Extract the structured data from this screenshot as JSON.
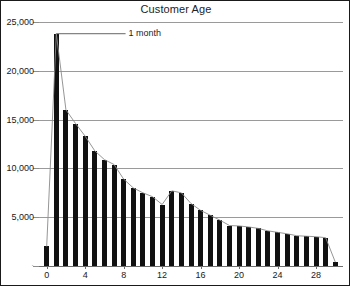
{
  "chart_data": {
    "type": "bar",
    "title": "Customer Age",
    "xlabel": "",
    "ylabel": "",
    "xlim": [
      -0.8,
      30.8
    ],
    "ylim": [
      0,
      25000
    ],
    "grid": true,
    "legend": false,
    "x": [
      0,
      1,
      2,
      3,
      4,
      5,
      6,
      7,
      8,
      9,
      10,
      11,
      12,
      13,
      14,
      15,
      16,
      17,
      18,
      19,
      20,
      21,
      22,
      23,
      24,
      25,
      26,
      27,
      28,
      29,
      30
    ],
    "categories": [
      "0",
      "1",
      "2",
      "3",
      "4",
      "5",
      "6",
      "7",
      "8",
      "9",
      "10",
      "11",
      "12",
      "13",
      "14",
      "15",
      "16",
      "17",
      "18",
      "19",
      "20",
      "21",
      "22",
      "23",
      "24",
      "25",
      "26",
      "27",
      "28",
      "29",
      "30"
    ],
    "values": [
      2000,
      23800,
      16000,
      14600,
      13300,
      11800,
      10900,
      10400,
      8900,
      8000,
      7500,
      7100,
      6300,
      7700,
      7500,
      6400,
      5700,
      5200,
      4700,
      4150,
      4100,
      4000,
      3850,
      3600,
      3450,
      3300,
      3100,
      3050,
      3000,
      2900,
      400
    ],
    "xticks": [
      0,
      4,
      8,
      12,
      16,
      20,
      24,
      28
    ],
    "xtick_labels": [
      "0",
      "4",
      "8",
      "12",
      "16",
      "20",
      "24",
      "28"
    ],
    "yticks": [
      0,
      5000,
      10000,
      15000,
      20000,
      25000
    ],
    "ytick_labels": [
      "",
      "5,000",
      "10,000",
      "15,000",
      "20,000",
      "25,000"
    ],
    "annotations": [
      {
        "text": "1 month",
        "points_to_x": 1,
        "points_to_y": 23800
      }
    ],
    "bar_color": "#111111",
    "outline_color": "#8a8a8a",
    "grid_color": "#9a9a9a"
  },
  "figure": {
    "background": "#ffffff",
    "border_color": "#1a1a1a"
  }
}
